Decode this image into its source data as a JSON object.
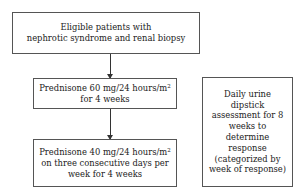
{
  "diagram": {
    "type": "flowchart",
    "nodes": [
      {
        "id": "eligible",
        "lines": [
          "Eligible patients with",
          "nephrotic syndrome and renal biopsy"
        ]
      },
      {
        "id": "prednisone_60",
        "line1_main": "Prednisone 60 mg/24 hours/m",
        "line1_sup": "2",
        "line2": "for 4 weeks"
      },
      {
        "id": "prednisone_40",
        "line1_main": "Prednisone 40 mg/24 hours/m",
        "line1_sup": "2",
        "line2": "on three consecutive days per",
        "line3": "week for 4 weeks"
      },
      {
        "id": "urine_dipstick",
        "lines": [
          "Daily urine",
          "dipstick",
          "assessment for 8",
          "weeks to",
          "determine",
          "response",
          "(categorized by",
          "week of response)"
        ]
      }
    ],
    "edges": [
      {
        "from": "eligible",
        "to": "prednisone_60"
      },
      {
        "from": "prednisone_60",
        "to": "prednisone_40"
      }
    ]
  }
}
